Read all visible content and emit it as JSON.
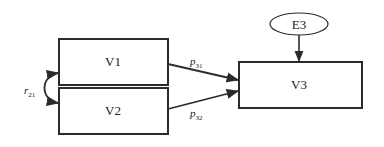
{
  "diagram": {
    "type": "path-model",
    "colors": {
      "stroke": "#2b2b2b",
      "text": "#222222",
      "background": "#ffffff"
    },
    "nodes": [
      {
        "id": "V1",
        "label": "V1",
        "shape": "rect"
      },
      {
        "id": "V2",
        "label": "V2",
        "shape": "rect"
      },
      {
        "id": "V3",
        "label": "V3",
        "shape": "rect"
      },
      {
        "id": "E3",
        "label": "E3",
        "shape": "ellipse"
      }
    ],
    "edges": [
      {
        "from": "V1",
        "to": "V3",
        "label": "p",
        "subscript": "31"
      },
      {
        "from": "V2",
        "to": "V3",
        "label": "p",
        "subscript": "32"
      },
      {
        "from": "E3",
        "to": "V3",
        "label": ""
      },
      {
        "from": "V2",
        "to": "V1",
        "label": "r",
        "subscript": "21",
        "style": "curved-double"
      }
    ]
  }
}
